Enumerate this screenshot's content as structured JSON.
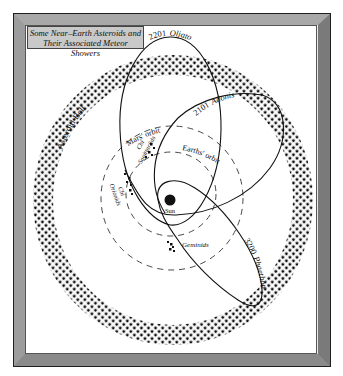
{
  "title": {
    "line1": "Some Near–Earth Asteroids and",
    "line2": "Their Associated Meteor Showers"
  },
  "bodies": {
    "sun": "Sun"
  },
  "regions": {
    "asteroid_belt": "Asteroid Belt"
  },
  "orbits": {
    "mars": "Mars' orbit",
    "earth": "Earths' orbit",
    "oljato_num": "2201",
    "oljato_name": "Oljato",
    "adonis_num": "2101",
    "adonis_name": "Adonis",
    "phaethon_num": "3200",
    "phaethon_name": "Phaethon"
  },
  "meteor_showers": {
    "chi_sagittariids_1": "Chi",
    "chi_sagittariids_2": "Sagittariids",
    "chi_orionids_1": "Chi",
    "chi_orionids_2": "Orionids",
    "geminids": "Geminids"
  },
  "colors": {
    "ink": "#111111",
    "frame_dark": "#3a3a3a",
    "title_bg": "#c9c9c9",
    "panel": "#ffffff"
  }
}
